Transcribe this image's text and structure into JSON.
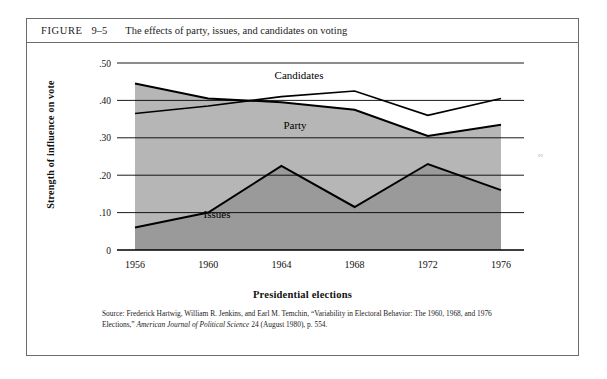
{
  "figure": {
    "label": "FIGURE",
    "number": "9–5",
    "title": "The effects of party, issues, and candidates on voting"
  },
  "source": {
    "prefix": "Source: Frederick Hartwig, William R. Jenkins, and Earl M. Temchin, “Variability in Electoral Behavior: The 1960, 1968, and 1976 Elections,” ",
    "journal": "American Journal of Political Science",
    "suffix": " 24 (August 1980), p. 554."
  },
  "chart_data": {
    "type": "area",
    "title": "The effects of party, issues, and candidates on voting",
    "xlabel": "Presidential elections",
    "ylabel": "Strength of influence on vote",
    "categories": [
      "1956",
      "1960",
      "1964",
      "1968",
      "1972",
      "1976"
    ],
    "ylim": [
      0,
      0.5
    ],
    "yticks": [
      0,
      0.1,
      0.2,
      0.3,
      0.4,
      0.5
    ],
    "ytick_labels": [
      "0",
      ".10",
      ".20",
      ".30",
      ".40",
      ".50"
    ],
    "grid": true,
    "legend": "inline-annotations",
    "series": [
      {
        "name": "Party",
        "label": "Party",
        "values": [
          0.445,
          0.405,
          0.395,
          0.375,
          0.305,
          0.335
        ],
        "fill": "#b6b6b6",
        "line": "#000000"
      },
      {
        "name": "Candidates",
        "label": "Candidates",
        "values": [
          0.365,
          0.385,
          0.41,
          0.425,
          0.36,
          0.405
        ],
        "fill": "none",
        "line": "#000000"
      },
      {
        "name": "Issues",
        "label": "Issues",
        "values": [
          0.06,
          0.1,
          0.225,
          0.115,
          0.23,
          0.16
        ],
        "fill": "#9a9a9a",
        "line": "#000000"
      }
    ]
  },
  "colors": {
    "party_band": "#b6b6b6",
    "issues_band": "#9a9a9a",
    "frame": "#6b6b6b",
    "gridline": "#000000"
  },
  "artifact_mark": "°°"
}
